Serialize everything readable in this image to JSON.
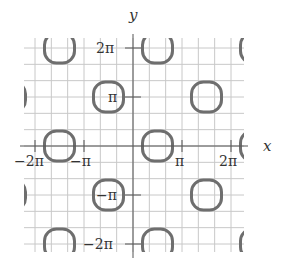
{
  "chart_data": {
    "type": "diagram",
    "xlabel": "x",
    "ylabel": "y",
    "x_ticks": [
      "-2π",
      "-π",
      "π",
      "2π"
    ],
    "y_ticks": [
      "2π",
      "π",
      "-π",
      "-2π"
    ],
    "grid": true,
    "grid_step": "π/3",
    "xlim": [
      "-2.2π",
      "2.3π"
    ],
    "ylim": [
      "-2.2π",
      "2.2π"
    ],
    "curve_centers": [
      {
        "x": "-1.5π",
        "y": "2π"
      },
      {
        "x": "0.5π",
        "y": "2π"
      },
      {
        "x": "2.5π",
        "y": "2π"
      },
      {
        "x": "-2.5π",
        "y": "π"
      },
      {
        "x": "-0.5π",
        "y": "π"
      },
      {
        "x": "1.5π",
        "y": "π"
      },
      {
        "x": "-1.5π",
        "y": "0"
      },
      {
        "x": "0.5π",
        "y": "0"
      },
      {
        "x": "2.5π",
        "y": "0"
      },
      {
        "x": "-2.5π",
        "y": "-π"
      },
      {
        "x": "-0.5π",
        "y": "-π"
      },
      {
        "x": "1.5π",
        "y": "-π"
      },
      {
        "x": "-1.5π",
        "y": "-2π"
      },
      {
        "x": "0.5π",
        "y": "-2π"
      },
      {
        "x": "2.5π",
        "y": "-2π"
      }
    ]
  },
  "labels": {
    "x_axis": "x",
    "y_axis": "y",
    "x_neg2pi": "−2π",
    "x_negpi": "−π",
    "x_pi": "π",
    "x_2pi": "2π",
    "y_2pi": "2π",
    "y_pi": "π",
    "y_negpi": "−π",
    "y_neg2pi": "−2π"
  },
  "colors": {
    "grid": "#c8c8c8",
    "axis": "#555555",
    "curve": "#6e6e6e",
    "text": "#333333"
  }
}
